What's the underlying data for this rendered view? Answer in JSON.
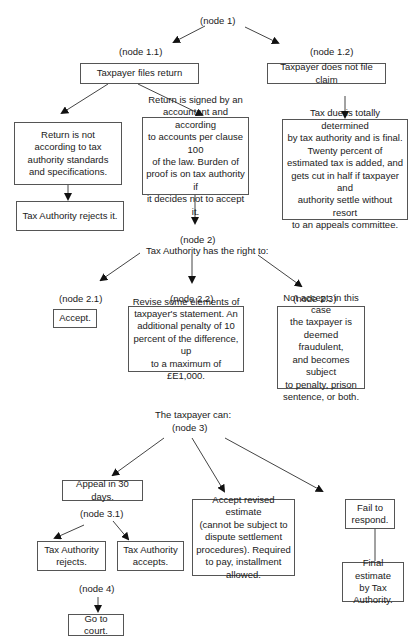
{
  "diagram": {
    "type": "decision-tree",
    "nodes": {
      "n1": {
        "label": "(node 1)"
      },
      "n1_1": {
        "label": "(node 1.1)",
        "box": "Taxpayer files return"
      },
      "n1_2": {
        "label": "(node 1.2)",
        "box": "Taxpayer does not file claim"
      },
      "n1_1_a": {
        "box": "Return is not\naccording to tax\nauthority standards\nand specifications."
      },
      "n1_1_a_result": {
        "box": "Tax Authority rejects it."
      },
      "n1_1_b": {
        "box": "Return is signed by an\naccountant and according\nto accounts per clause 100\nof the law. Burden of\nproof is on tax authority if\nit decides not to accept it."
      },
      "n1_2_result": {
        "box": "Tax due is totally determined\nby tax authority and is final.\nTwenty percent of\nestimated tax is added, and\ngets cut in half if taxpayer and\nauthority settle without resort\nto an appeals committee."
      },
      "n2": {
        "label": "(node 2)",
        "caption": "Tax Authority has the right to:"
      },
      "n2_1": {
        "label": "(node 2.1)",
        "box": "Accept."
      },
      "n2_2": {
        "label": "(node 2.2)",
        "box": "Revise some elements of\ntaxpayer's statement. An\nadditional penalty of 10\npercent of the difference, up\nto a maximum of £E1,000."
      },
      "n2_3": {
        "label": "(node 2.3)",
        "box": "Not accept; in this case\nthe taxpayer is\ndeemed fraudulent,\nand becomes subject\nto penalty, prison\nsentence, or both."
      },
      "n3": {
        "caption": "The taxpayer can:",
        "label": "(node 3)"
      },
      "n3_a": {
        "box": "Appeal in 30 days."
      },
      "n3_1": {
        "label": "(node 3.1)"
      },
      "n3_1_a": {
        "box": "Tax Authority\nrejects."
      },
      "n3_1_b": {
        "box": "Tax Authority\naccepts."
      },
      "n3_b": {
        "box": "Accept revised estimate\n(cannot be subject to\ndispute settlement\nprocedures). Required\nto pay, installment\nallowed."
      },
      "n3_c": {
        "box": "Fail to\nrespond."
      },
      "n3_c_result": {
        "box": "Final estimate\nby Tax\nAuthority."
      },
      "n4": {
        "label": "(node 4)",
        "box": "Go to court."
      }
    },
    "colors": {
      "line": "#555555",
      "text": "#1a1a1a",
      "background": "#ffffff"
    }
  }
}
